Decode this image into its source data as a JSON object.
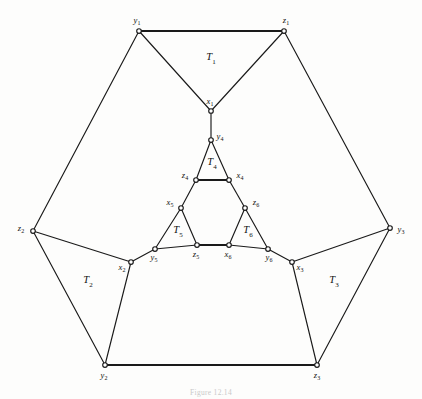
{
  "figure": {
    "caption": "Figure 12.14",
    "background_color": "#fdfdfc",
    "line_color": "#1a1a1a",
    "node_fill_color": "#ffffff"
  },
  "chart_data": {
    "type": "diagram",
    "title": "",
    "subtitle": "",
    "xlabel": "",
    "ylabel": "",
    "layout": "planar graph drawing, hexagonal outer boundary with nested inner triangle",
    "width": 422,
    "height": 399,
    "nodes": [
      {
        "id": "y1",
        "base": "y",
        "sub": "1",
        "x": 139,
        "y": 31,
        "label_dx": -2,
        "label_dy": -10,
        "anchor": "middle"
      },
      {
        "id": "z1",
        "base": "z",
        "sub": "1",
        "x": 284,
        "y": 31,
        "label_dx": 2,
        "label_dy": -10,
        "anchor": "middle"
      },
      {
        "id": "z2",
        "base": "z",
        "sub": "2",
        "x": 33,
        "y": 231,
        "label_dx": -12,
        "label_dy": -2,
        "anchor": "middle"
      },
      {
        "id": "y3",
        "base": "y",
        "sub": "3",
        "x": 390,
        "y": 228,
        "label_dx": 11,
        "label_dy": 2,
        "anchor": "middle"
      },
      {
        "id": "y2",
        "base": "y",
        "sub": "2",
        "x": 105,
        "y": 365,
        "label_dx": -1,
        "label_dy": 11,
        "anchor": "middle"
      },
      {
        "id": "z3",
        "base": "z",
        "sub": "3",
        "x": 317,
        "y": 365,
        "label_dx": 0,
        "label_dy": 11,
        "anchor": "middle"
      },
      {
        "id": "x1",
        "base": "x",
        "sub": "1",
        "x": 211,
        "y": 111,
        "label_dx": -1,
        "label_dy": -9,
        "anchor": "middle"
      },
      {
        "id": "x2",
        "base": "x",
        "sub": "2",
        "x": 131,
        "y": 262,
        "label_dx": -9,
        "label_dy": 6,
        "anchor": "middle"
      },
      {
        "id": "x3",
        "base": "x",
        "sub": "3",
        "x": 292,
        "y": 262,
        "label_dx": 8,
        "label_dy": 6,
        "anchor": "middle"
      },
      {
        "id": "y4",
        "base": "y",
        "sub": "4",
        "x": 211,
        "y": 140,
        "label_dx": 9,
        "label_dy": -3,
        "anchor": "middle"
      },
      {
        "id": "z4",
        "base": "z",
        "sub": "4",
        "x": 196,
        "y": 180,
        "label_dx": -11,
        "label_dy": -4,
        "anchor": "middle"
      },
      {
        "id": "x4",
        "base": "x",
        "sub": "4",
        "x": 229,
        "y": 180,
        "label_dx": 11,
        "label_dy": -4,
        "anchor": "middle"
      },
      {
        "id": "x5",
        "base": "x",
        "sub": "5",
        "x": 181,
        "y": 208,
        "label_dx": -11,
        "label_dy": -5,
        "anchor": "middle"
      },
      {
        "id": "z6",
        "base": "z",
        "sub": "6",
        "x": 245,
        "y": 208,
        "label_dx": 11,
        "label_dy": -5,
        "anchor": "middle"
      },
      {
        "id": "y5",
        "base": "y",
        "sub": "5",
        "x": 155,
        "y": 249,
        "label_dx": -1,
        "label_dy": 9,
        "anchor": "middle"
      },
      {
        "id": "z5",
        "base": "z",
        "sub": "5",
        "x": 197,
        "y": 245,
        "label_dx": -1,
        "label_dy": 10,
        "anchor": "middle"
      },
      {
        "id": "x6",
        "base": "x",
        "sub": "6",
        "x": 229,
        "y": 245,
        "label_dx": -1,
        "label_dy": 10,
        "anchor": "middle"
      },
      {
        "id": "y6",
        "base": "y",
        "sub": "6",
        "x": 268,
        "y": 249,
        "label_dx": 1,
        "label_dy": 9,
        "anchor": "middle"
      }
    ],
    "edges": [
      {
        "from": "y1",
        "to": "z1",
        "weight": "thick"
      },
      {
        "from": "y1",
        "to": "x1",
        "weight": "normal"
      },
      {
        "from": "z1",
        "to": "x1",
        "weight": "normal"
      },
      {
        "from": "y1",
        "to": "z2",
        "weight": "normal"
      },
      {
        "from": "z1",
        "to": "y3",
        "weight": "normal"
      },
      {
        "from": "z2",
        "to": "x2",
        "weight": "normal"
      },
      {
        "from": "z2",
        "to": "y2",
        "weight": "normal"
      },
      {
        "from": "y3",
        "to": "x3",
        "weight": "normal"
      },
      {
        "from": "y3",
        "to": "z3",
        "weight": "normal"
      },
      {
        "from": "y2",
        "to": "z3",
        "weight": "thick"
      },
      {
        "from": "y2",
        "to": "x2",
        "weight": "normal"
      },
      {
        "from": "z3",
        "to": "x3",
        "weight": "normal"
      },
      {
        "from": "x1",
        "to": "y4",
        "weight": "normal"
      },
      {
        "from": "x2",
        "to": "y5",
        "weight": "normal"
      },
      {
        "from": "x3",
        "to": "y6",
        "weight": "normal"
      },
      {
        "from": "y4",
        "to": "z4",
        "weight": "normal"
      },
      {
        "from": "y4",
        "to": "x4",
        "weight": "normal"
      },
      {
        "from": "z4",
        "to": "x4",
        "weight": "thick"
      },
      {
        "from": "z4",
        "to": "x5",
        "weight": "normal"
      },
      {
        "from": "x4",
        "to": "z6",
        "weight": "normal"
      },
      {
        "from": "x5",
        "to": "y5",
        "weight": "normal"
      },
      {
        "from": "x5",
        "to": "z5",
        "weight": "normal"
      },
      {
        "from": "y5",
        "to": "z5",
        "weight": "normal"
      },
      {
        "from": "z5",
        "to": "x6",
        "weight": "thick"
      },
      {
        "from": "z6",
        "to": "x6",
        "weight": "normal"
      },
      {
        "from": "z6",
        "to": "y6",
        "weight": "normal"
      },
      {
        "from": "x6",
        "to": "y6",
        "weight": "normal"
      }
    ],
    "region_labels": [
      {
        "id": "T1",
        "base": "T",
        "sub": "1",
        "x": 211,
        "y": 58
      },
      {
        "id": "T2",
        "base": "T",
        "sub": "2",
        "x": 88,
        "y": 281
      },
      {
        "id": "T3",
        "base": "T",
        "sub": "3",
        "x": 334,
        "y": 281
      },
      {
        "id": "T4",
        "base": "T",
        "sub": "4",
        "x": 212,
        "y": 163
      },
      {
        "id": "T5",
        "base": "T",
        "sub": "5",
        "x": 178,
        "y": 231
      },
      {
        "id": "T6",
        "base": "T",
        "sub": "6",
        "x": 248,
        "y": 231
      }
    ]
  }
}
